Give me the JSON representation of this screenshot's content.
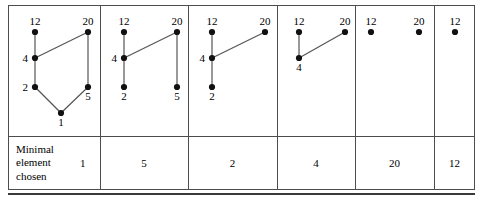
{
  "figure": {
    "caption_row": {
      "label": "Minimal\nelement\nchosen",
      "values": [
        "1",
        "5",
        "2",
        "4",
        "20",
        "12"
      ]
    },
    "panels": [
      {
        "name": "step-1",
        "nodes": [
          {
            "id": "12",
            "label": "12",
            "x": 27,
            "y": 27,
            "label_pos": "above"
          },
          {
            "id": "20",
            "label": "20",
            "x": 80,
            "y": 27,
            "label_pos": "above"
          },
          {
            "id": "4",
            "label": "4",
            "x": 27,
            "y": 53,
            "label_pos": "left"
          },
          {
            "id": "2",
            "label": "2",
            "x": 27,
            "y": 82,
            "label_pos": "left"
          },
          {
            "id": "5",
            "label": "5",
            "x": 80,
            "y": 82,
            "label_pos": "below"
          },
          {
            "id": "1",
            "label": "1",
            "x": 53,
            "y": 108,
            "label_pos": "below"
          }
        ],
        "edges": [
          [
            "12",
            "4"
          ],
          [
            "4",
            "20"
          ],
          [
            "4",
            "2"
          ],
          [
            "2",
            "1"
          ],
          [
            "1",
            "5"
          ],
          [
            "5",
            "20"
          ]
        ]
      },
      {
        "name": "step-2",
        "nodes": [
          {
            "id": "12",
            "label": "12",
            "x": 24,
            "y": 27,
            "label_pos": "above"
          },
          {
            "id": "20",
            "label": "20",
            "x": 77,
            "y": 27,
            "label_pos": "above"
          },
          {
            "id": "4",
            "label": "4",
            "x": 24,
            "y": 53,
            "label_pos": "left"
          },
          {
            "id": "2",
            "label": "2",
            "x": 24,
            "y": 82,
            "label_pos": "below"
          },
          {
            "id": "5",
            "label": "5",
            "x": 77,
            "y": 82,
            "label_pos": "below"
          }
        ],
        "edges": [
          [
            "12",
            "4"
          ],
          [
            "4",
            "20"
          ],
          [
            "4",
            "2"
          ],
          [
            "20",
            "5"
          ]
        ]
      },
      {
        "name": "step-3",
        "nodes": [
          {
            "id": "12",
            "label": "12",
            "x": 24,
            "y": 27,
            "label_pos": "above"
          },
          {
            "id": "20",
            "label": "20",
            "x": 77,
            "y": 27,
            "label_pos": "above"
          },
          {
            "id": "4",
            "label": "4",
            "x": 24,
            "y": 53,
            "label_pos": "left"
          },
          {
            "id": "2",
            "label": "2",
            "x": 24,
            "y": 82,
            "label_pos": "below"
          }
        ],
        "edges": [
          [
            "12",
            "4"
          ],
          [
            "4",
            "20"
          ],
          [
            "4",
            "2"
          ]
        ]
      },
      {
        "name": "step-4",
        "nodes": [
          {
            "id": "12",
            "label": "12",
            "x": 22,
            "y": 27,
            "label_pos": "above"
          },
          {
            "id": "20",
            "label": "20",
            "x": 68,
            "y": 27,
            "label_pos": "above"
          },
          {
            "id": "4",
            "label": "4",
            "x": 22,
            "y": 53,
            "label_pos": "below"
          }
        ],
        "edges": [
          [
            "12",
            "4"
          ],
          [
            "4",
            "20"
          ]
        ]
      },
      {
        "name": "step-5",
        "nodes": [
          {
            "id": "12",
            "label": "12",
            "x": 16,
            "y": 27,
            "label_pos": "above"
          },
          {
            "id": "20",
            "label": "20",
            "x": 64,
            "y": 27,
            "label_pos": "above"
          }
        ],
        "edges": []
      },
      {
        "name": "step-6",
        "nodes": [
          {
            "id": "12",
            "label": "12",
            "x": 21,
            "y": 27,
            "label_pos": "above"
          }
        ],
        "edges": []
      }
    ],
    "layout": {
      "column_edges": [
        0,
        92,
        180,
        269,
        347,
        426,
        467
      ],
      "row_divider_y": 131,
      "node_radius": 3.1,
      "edge_color": "#555555",
      "node_color": "#111111",
      "border_color": "#4d4d4d"
    }
  }
}
